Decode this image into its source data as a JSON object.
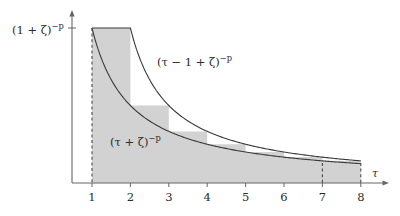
{
  "figure": {
    "background_color": "#ffffff",
    "axis_color": "#555555",
    "curve_color": "#3a3a3a",
    "fill_color": "#d2d2d2",
    "dash_color": "#4a4a4a",
    "y_axis_label": "(1 + ζ)⁻ᵖ",
    "y_axis_label_parts": {
      "base": "(1 + ζ)",
      "exponent": "−p"
    },
    "x_axis_name": "τ",
    "upper_curve_label": "(τ − 1 + ζ)⁻ᵖ",
    "upper_curve_label_parts": {
      "base": "(τ − 1 + ζ)",
      "exponent": "−p"
    },
    "lower_curve_label": "(τ + ζ)⁻ᵖ",
    "lower_curve_label_parts": {
      "base": "(τ + ζ)",
      "exponent": "−p"
    }
  },
  "chart_data": {
    "type": "area",
    "title": "",
    "xlabel": "τ",
    "ylabel": "(1 + ζ)⁻ᵖ",
    "xlim": [
      0,
      8.6
    ],
    "ylim": [
      0,
      1.12
    ],
    "grid": false,
    "legend": "none",
    "x_ticks": [
      1,
      2,
      3,
      4,
      5,
      6,
      7,
      8
    ],
    "x_tick_labels": [
      "1",
      "2",
      "3",
      "4",
      "5",
      "6",
      "7",
      "8"
    ],
    "y_ticks": [
      1.0
    ],
    "y_tick_labels": [
      "(1 + ζ)⁻ᵖ"
    ],
    "parameters": {
      "zeta": 0.0,
      "p": 1.0
    },
    "series": [
      {
        "name": "(τ − 1 + ζ)⁻ᵖ",
        "type": "line",
        "formula": "(tau - 1 + zeta)^(-p)",
        "x": [
          1.0,
          1.25,
          1.5,
          1.75,
          2.0,
          2.5,
          3.0,
          3.5,
          4.0,
          4.5,
          5.0,
          5.5,
          6.0,
          6.5,
          7.0,
          7.5,
          8.0
        ],
        "y": [
          1.0,
          1.0,
          1.0,
          1.0,
          1.0,
          0.667,
          0.5,
          0.4,
          0.333,
          0.286,
          0.25,
          0.222,
          0.2,
          0.182,
          0.167,
          0.154,
          0.143
        ]
      },
      {
        "name": "(τ + ζ)⁻ᵖ",
        "type": "line",
        "formula": "(tau + zeta)^(-p)",
        "x": [
          1.0,
          1.25,
          1.5,
          1.75,
          2.0,
          2.5,
          3.0,
          3.5,
          4.0,
          4.5,
          5.0,
          5.5,
          6.0,
          6.5,
          7.0,
          7.5,
          8.0
        ],
        "y": [
          1.0,
          0.8,
          0.667,
          0.571,
          0.5,
          0.4,
          0.333,
          0.286,
          0.25,
          0.222,
          0.2,
          0.182,
          0.167,
          0.154,
          0.143,
          0.133,
          0.125
        ]
      },
      {
        "name": "step-region",
        "type": "bar",
        "description": "shaded staircase between the two curves",
        "categories": [
          "[1,2]",
          "[2,3]",
          "[3,4]",
          "[4,5]",
          "[5,6]",
          "[6,7]",
          "[7,8]"
        ],
        "values": [
          1.0,
          0.5,
          0.333,
          0.25,
          0.2,
          0.167,
          0.143
        ]
      }
    ],
    "annotations": [
      {
        "text": "(τ − 1 + ζ)⁻ᵖ",
        "x": 3.2,
        "y": 0.73
      },
      {
        "text": "(τ + ζ)⁻ᵖ",
        "x": 2.1,
        "y": 0.35
      }
    ]
  }
}
